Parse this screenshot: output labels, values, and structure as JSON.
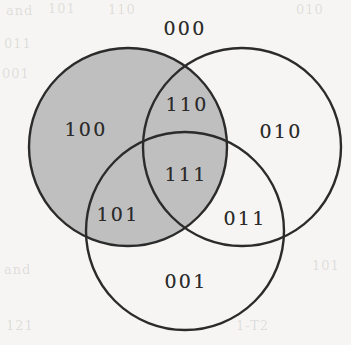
{
  "figure": {
    "name": "three-set-venn-diagram",
    "background_color": "#f6f5f3",
    "stroke_color": "#2b2b2b",
    "shaded_fill_color": "#bfbfbf",
    "unshaded_fill_color": "#f6f5f3"
  },
  "chart_data": {
    "type": "diagram",
    "diagram_type": "venn",
    "title": "",
    "set_count": 3,
    "circles": [
      {
        "id": "A",
        "position": "left",
        "cx": 128,
        "cy": 147,
        "r": 99,
        "shaded": true
      },
      {
        "id": "B",
        "position": "right",
        "cx": 242,
        "cy": 147,
        "r": 99,
        "shaded": false
      },
      {
        "id": "C",
        "position": "bottom",
        "cx": 185,
        "cy": 231,
        "r": 99,
        "shaded": false
      }
    ],
    "regions": [
      {
        "label": "000",
        "membership": [
          false,
          false,
          false
        ],
        "shaded": false,
        "x": 185,
        "y": 28
      },
      {
        "label": "110",
        "membership": [
          true,
          true,
          false
        ],
        "shaded": true,
        "x": 187,
        "y": 104
      },
      {
        "label": "100",
        "membership": [
          true,
          false,
          false
        ],
        "shaded": true,
        "x": 86,
        "y": 129
      },
      {
        "label": "010",
        "membership": [
          false,
          true,
          false
        ],
        "shaded": false,
        "x": 281,
        "y": 131
      },
      {
        "label": "111",
        "membership": [
          true,
          true,
          true
        ],
        "shaded": true,
        "x": 186,
        "y": 174
      },
      {
        "label": "101",
        "membership": [
          true,
          false,
          true
        ],
        "shaded": true,
        "x": 118,
        "y": 214
      },
      {
        "label": "011",
        "membership": [
          false,
          true,
          true
        ],
        "shaded": false,
        "x": 245,
        "y": 218
      },
      {
        "label": "001",
        "membership": [
          false,
          false,
          true
        ],
        "shaded": false,
        "x": 186,
        "y": 281
      }
    ],
    "shaded_regions": [
      "100",
      "110",
      "101",
      "111"
    ],
    "unshaded_regions": [
      "000",
      "010",
      "011",
      "001"
    ]
  },
  "bleed_text": [
    {
      "text": "and",
      "x": 6,
      "y": 3
    },
    {
      "text": "101",
      "x": 48,
      "y": 1
    },
    {
      "text": "110",
      "x": 108,
      "y": 2
    },
    {
      "text": "010",
      "x": 296,
      "y": 2
    },
    {
      "text": "011",
      "x": 4,
      "y": 36
    },
    {
      "text": "001",
      "x": 2,
      "y": 66
    },
    {
      "text": "and",
      "x": 4,
      "y": 262
    },
    {
      "text": "101",
      "x": 312,
      "y": 258
    },
    {
      "text": "121",
      "x": 6,
      "y": 318
    },
    {
      "text": "1-T2",
      "x": 236,
      "y": 318
    }
  ]
}
